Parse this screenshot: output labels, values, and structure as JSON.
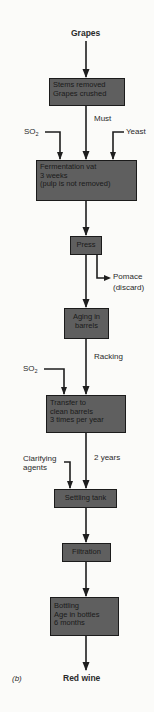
{
  "diagram": {
    "panel_label": "(b)",
    "input": "Grapes",
    "output": "Red wine",
    "colors": {
      "box_fill": "#5f5f5f",
      "box_border": "#1b1b1b",
      "arrow": "#1e1e1e",
      "background": "#fbfbf9"
    },
    "steps": [
      {
        "id": "crush",
        "lines": [
          "Stems removed",
          "Grapes crushed"
        ]
      },
      {
        "id": "ferment",
        "lines": [
          "Fermentation vat",
          "3 weeks",
          "(pulp is not removed)"
        ]
      },
      {
        "id": "press",
        "lines": [
          "Press"
        ]
      },
      {
        "id": "aging",
        "lines": [
          "Aging in",
          "barrels"
        ]
      },
      {
        "id": "transfer",
        "lines": [
          "Transfer to",
          "clean barrels",
          "3 times per year"
        ]
      },
      {
        "id": "settling",
        "lines": [
          "Settling tank"
        ]
      },
      {
        "id": "filtration",
        "lines": [
          "Filtration"
        ]
      },
      {
        "id": "bottling",
        "lines": [
          "Bottling",
          "Age in bottles",
          "6 months"
        ]
      }
    ],
    "edge_labels": {
      "must": "Must",
      "racking": "Racking",
      "two_years": "2 years"
    },
    "side_inputs": {
      "so2_ferment": {
        "base": "SO",
        "sub": "2"
      },
      "yeast": "Yeast",
      "so2_transfer": {
        "base": "SO",
        "sub": "2"
      },
      "clarifying": [
        "Clarifying",
        "agents"
      ]
    },
    "side_outputs": {
      "pomace": [
        "Pomace",
        "(discard)"
      ]
    }
  }
}
